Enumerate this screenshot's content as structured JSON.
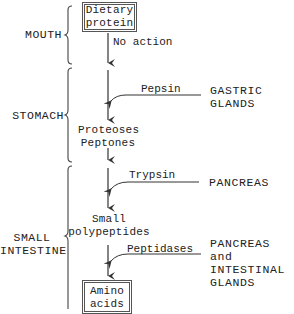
{
  "diagram": {
    "regions": [
      {
        "id": "mouth",
        "label": "MOUTH"
      },
      {
        "id": "stomach",
        "label": "STOMACH"
      },
      {
        "id": "small_intestine",
        "label_line1": "SMALL",
        "label_line2": "INTESTINE"
      }
    ],
    "nodes": {
      "start": {
        "line1": "Dietary",
        "line2": "protein"
      },
      "proteoses": {
        "line1": "Proteoses",
        "line2": "Peptones"
      },
      "polypeptides": {
        "line1": "Small",
        "line2": "polypeptides"
      },
      "end": {
        "line1": "Amino",
        "line2": "acids"
      }
    },
    "steps": [
      {
        "action": "No action"
      },
      {
        "enzyme": "Pepsin",
        "source_line1": "GASTRIC",
        "source_line2": "GLANDS"
      },
      {
        "enzyme": "Trypsin",
        "source_line1": "PANCREAS"
      },
      {
        "enzyme": "Peptidases",
        "source_line1": "PANCREAS and",
        "source_line2": "INTESTINAL",
        "source_line3": "GLANDS"
      }
    ],
    "colors": {
      "line": "#333333",
      "box_border": "#555555",
      "text": "#222222"
    }
  }
}
